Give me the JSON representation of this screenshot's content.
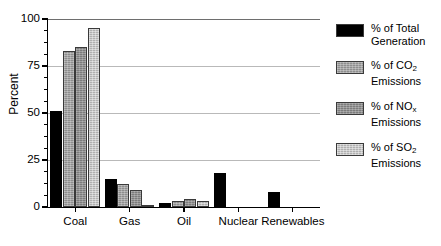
{
  "chart_data": {
    "type": "bar",
    "title": "",
    "xlabel": "",
    "ylabel": "Percent",
    "ylim": [
      0,
      100
    ],
    "yticks": [
      0,
      25,
      50,
      75,
      100
    ],
    "yticklabels": [
      "0",
      "25",
      "50",
      "75",
      "100"
    ],
    "grid": true,
    "legend_position": "right",
    "categories": [
      "Coal",
      "Gas",
      "Oil",
      "Nuclear",
      "Renewables"
    ],
    "series": [
      {
        "name": "% of Total Generation",
        "color": "#000000",
        "values": [
          51,
          15,
          2,
          18,
          8
        ]
      },
      {
        "name": "% of CO2 Emissions",
        "color": "#8e8e8e",
        "values": [
          83,
          12,
          3,
          0,
          0
        ]
      },
      {
        "name": "% of NOx Emissions",
        "color": "#7c7c7c",
        "values": [
          85,
          9,
          4,
          0,
          0
        ]
      },
      {
        "name": "% of SO2 Emissions",
        "color": "#b0b0b0",
        "values": [
          95,
          1,
          3,
          0,
          0
        ]
      }
    ]
  },
  "axis": {
    "y_title": "Percent",
    "y_labels": [
      "100",
      "75",
      "50",
      "25",
      "0"
    ],
    "x_labels": [
      "Coal",
      "Gas",
      "Oil",
      "Nuclear",
      "Renewables"
    ]
  },
  "legend": {
    "items": [
      {
        "line1": "% of Total",
        "line2": "Generation",
        "sub": "",
        "base": ""
      },
      {
        "line1": "% of CO",
        "line2": "Emissions",
        "sub": "2",
        "base": ""
      },
      {
        "line1": "% of NO",
        "line2": "Emissions",
        "sub": "x",
        "base": ""
      },
      {
        "line1": "% of SO",
        "line2": "Emissions",
        "sub": "2",
        "base": ""
      }
    ]
  }
}
